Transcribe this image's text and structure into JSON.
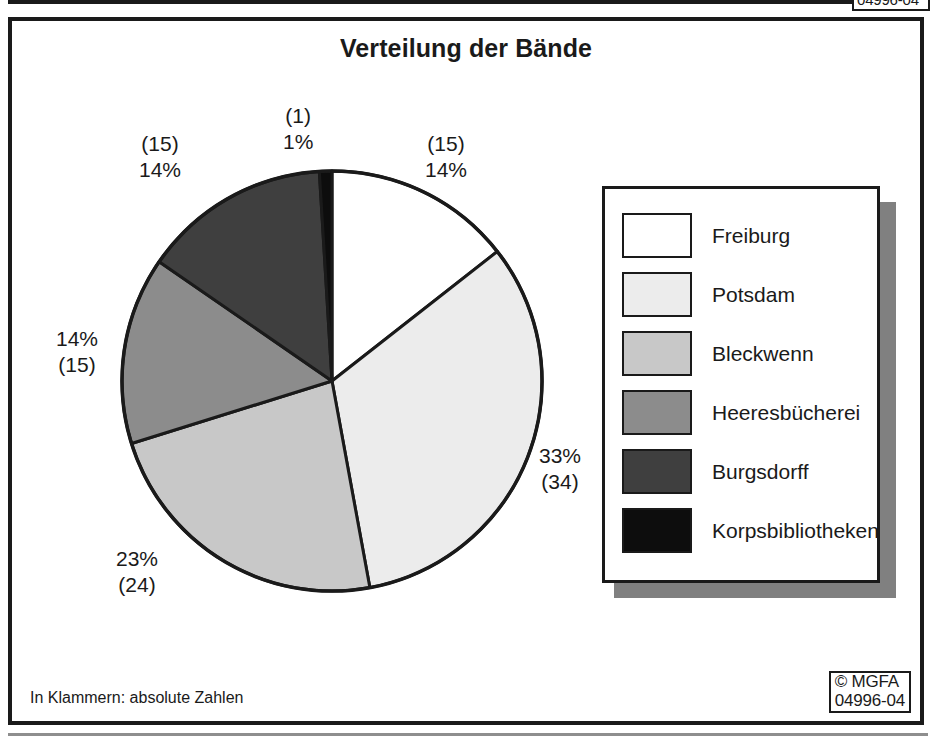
{
  "figure": {
    "title": "Verteilung der Bände",
    "footnote": "In Klammern: absolute Zahlen"
  },
  "top_remnant": {
    "clipped_text": "04996-04"
  },
  "copyright": {
    "line1": "© MGFA",
    "line2": "04996-04"
  },
  "legend": {
    "items": [
      {
        "label": "Freiburg",
        "color": "#ffffff"
      },
      {
        "label": "Potsdam",
        "color": "#ececec"
      },
      {
        "label": "Bleckwenn",
        "color": "#c8c8c8"
      },
      {
        "label": "Heeresbücherei",
        "color": "#8c8c8c"
      },
      {
        "label": "Burgsdorff",
        "color": "#3f3f3f"
      },
      {
        "label": "Korpsbibliotheken",
        "color": "#0d0d0d"
      }
    ]
  },
  "callouts": {
    "korpsbibliotheken": {
      "count": "(1)",
      "percent": "1%"
    },
    "burgsdorff": {
      "count": "(15)",
      "percent": "14%"
    },
    "freiburg": {
      "count": "(15)",
      "percent": "14%"
    },
    "heeresbuecherei": {
      "percent": "14%",
      "count": "(15)"
    },
    "potsdam": {
      "percent": "33%",
      "count": "(34)"
    },
    "bleckwenn": {
      "percent": "23%",
      "count": "(24)"
    }
  },
  "chart_data": {
    "type": "pie",
    "title": "Verteilung der Bände",
    "note": "In Klammern: absolute Zahlen",
    "unit": "Bände",
    "labels": [
      "Freiburg",
      "Potsdam",
      "Bleckwenn",
      "Heeresbücherei",
      "Burgsdorff",
      "Korpsbibliotheken"
    ],
    "values": [
      15,
      34,
      24,
      15,
      15,
      1
    ],
    "percents": [
      14,
      33,
      23,
      14,
      14,
      1
    ],
    "colors": [
      "#ffffff",
      "#ececec",
      "#c8c8c8",
      "#8c8c8c",
      "#3f3f3f",
      "#0d0d0d"
    ],
    "total": 104,
    "start_angle_deg": 0,
    "direction": "clockwise",
    "legend_position": "right",
    "data_labels": [
      "14%\n(15)",
      "33%\n(34)",
      "23%\n(24)",
      "14%\n(15)",
      "14%\n(15)",
      "1%\n(1)"
    ]
  },
  "geometry": {
    "pie_center": [
      228,
      233
    ],
    "pie_radius": 210
  }
}
